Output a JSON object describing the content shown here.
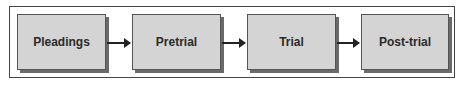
{
  "diagram": {
    "type": "flowchart",
    "stages": [
      {
        "label": "Pleadings"
      },
      {
        "label": "Pretrial"
      },
      {
        "label": "Trial"
      },
      {
        "label": "Post-trial"
      }
    ],
    "edges": [
      {
        "from": "Pleadings",
        "to": "Pretrial"
      },
      {
        "from": "Pretrial",
        "to": "Trial"
      },
      {
        "from": "Trial",
        "to": "Post-trial"
      }
    ]
  }
}
